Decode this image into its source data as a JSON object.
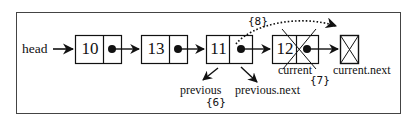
{
  "diagram": {
    "type": "linked-list-removal",
    "head_label": "head",
    "nodes": [
      {
        "value": "10",
        "has_pointer": true,
        "removed": false
      },
      {
        "value": "13",
        "has_pointer": true,
        "removed": false
      },
      {
        "value": "11",
        "has_pointer": true,
        "removed": false
      },
      {
        "value": "12",
        "has_pointer": true,
        "removed": true
      }
    ],
    "null_node": {
      "symbol": "null-box"
    },
    "labels": {
      "previous": "previous",
      "previous_next": "previous.next",
      "current": "current",
      "current_next": "current.next"
    },
    "steps": {
      "step6": "{6}",
      "step7": "{7}",
      "step8": "{8}"
    },
    "colors": {
      "stroke": "#111111",
      "frame": "#444444",
      "background": "#ffffff"
    }
  }
}
